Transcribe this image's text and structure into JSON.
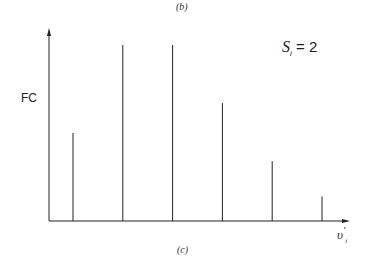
{
  "captions": {
    "top": "(b)",
    "bottom": "(c)"
  },
  "chart_data": {
    "type": "bar",
    "title": "",
    "annotation": "S_i = 2",
    "xlabel": "υ'_i",
    "ylabel": "FC",
    "categories": [
      "0",
      "1",
      "2",
      "3",
      "4",
      "5"
    ],
    "values": [
      0.5,
      1.0,
      1.0,
      0.67,
      0.34,
      0.14
    ],
    "ylim": [
      0,
      1.1
    ],
    "grid": false,
    "legend": "none",
    "style": "stick spectrum (vertical lines)"
  },
  "labels": {
    "ylabel": "FC",
    "anno_main": "S",
    "anno_sub": "i",
    "anno_eq": " = 2",
    "xlabel_main": "υ",
    "xlabel_sub": "i",
    "xlabel_prime": "'"
  }
}
